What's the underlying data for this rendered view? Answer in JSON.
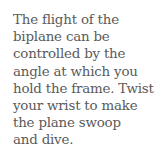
{
  "caption": {
    "lines": [
      "The flight of the",
      "biplane can be",
      "controlled by the",
      "angle at which you",
      "hold the frame. Twist",
      "your wrist to make",
      "the plane swoop",
      "and dive."
    ]
  }
}
